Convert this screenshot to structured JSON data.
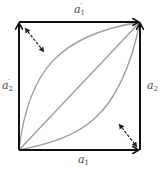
{
  "diagram": {
    "type": "commutative-square",
    "colors": {
      "frame": "#111111",
      "curves": "#9a9a9a",
      "double_arrows": "#222222",
      "labels": "#444444"
    },
    "labels": {
      "top": {
        "base": "a",
        "sub": "1",
        "prime": "′"
      },
      "left": {
        "base": "a",
        "sub": "2",
        "prime": "′"
      },
      "right": {
        "base": "a",
        "sub": "2",
        "prime": ""
      },
      "bottom": {
        "base": "a",
        "sub": "1",
        "prime": ""
      }
    },
    "edges": [
      {
        "name": "bottom-edge",
        "from": "bottom-left",
        "to": "bottom-right",
        "label": "a1"
      },
      {
        "name": "right-edge",
        "from": "bottom-right",
        "to": "top-right",
        "label": "a2"
      },
      {
        "name": "left-edge",
        "from": "bottom-left",
        "to": "top-left",
        "label": "a2'"
      },
      {
        "name": "top-edge",
        "from": "top-left",
        "to": "top-right",
        "label": "a1'"
      }
    ],
    "paths": [
      "upper-curve",
      "diagonal",
      "lower-curve"
    ],
    "homotopy_arrows": [
      "upper-left-double-arrow",
      "lower-right-double-arrow"
    ]
  }
}
